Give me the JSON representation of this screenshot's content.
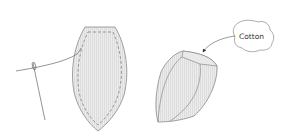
{
  "diagram": {
    "title": "",
    "labels": {
      "cotton": "Cotton"
    },
    "elements": [
      {
        "id": "fabric-petal",
        "description": "Flat petal-shaped fabric piece with dashed stitching line"
      },
      {
        "id": "needle-thread",
        "description": "Needle with thread attached to the fabric piece"
      },
      {
        "id": "stuffed-bud",
        "description": "Sewn and stuffed 3D bud shape"
      },
      {
        "id": "cotton-cloud",
        "description": "Cloud-shaped callout labeled Cotton with arrow pointing to bud opening"
      }
    ],
    "colors": {
      "outline": "#8a8a8a",
      "fill": "#e6e6e6",
      "hatch": "#d2d2d2",
      "stitch": "#777777",
      "text": "#333333"
    }
  }
}
